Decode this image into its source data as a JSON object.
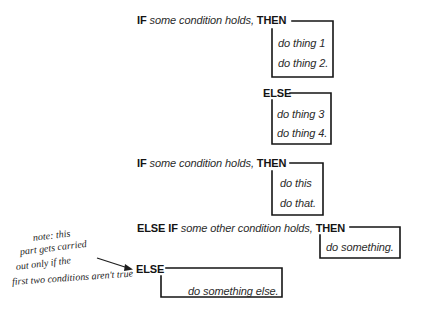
{
  "blocks": [
    {
      "keyword_if": "IF",
      "condition": "some condition holds,",
      "keyword_then": "THEN",
      "actions": [
        "do thing 1",
        "do thing 2."
      ]
    },
    {
      "keyword": "ELSE",
      "actions": [
        "do thing 3",
        "do thing 4."
      ]
    },
    {
      "keyword_if": "IF",
      "condition": "some condition holds,",
      "keyword_then": "THEN",
      "actions": [
        "do this",
        "do that."
      ]
    },
    {
      "keyword_if": "ELSE IF",
      "condition": "some other condition holds,",
      "keyword_then": "THEN",
      "actions": [
        "do something."
      ]
    },
    {
      "keyword": "ELSE",
      "actions": [
        "do something else."
      ]
    }
  ],
  "note": {
    "lines": [
      "note: this",
      "part gets carried",
      "out only if the",
      "first two conditions aren't true"
    ]
  },
  "colors": {
    "ink": "#141414",
    "background": "#ffffff"
  }
}
